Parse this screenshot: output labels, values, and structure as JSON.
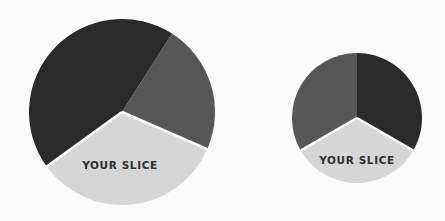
{
  "colors": {
    "background": "#fbfbfb",
    "dark": "#2a2a2a",
    "medium": "#575757",
    "light": "#d6d6d6",
    "separator": "#ffffff",
    "label": "#2f2f2f"
  },
  "chart_data": [
    {
      "type": "pie",
      "title": "",
      "center": [
        122,
        112
      ],
      "radius": 93,
      "start_angle_deg": 32.5,
      "direction": "clockwise-from-top",
      "slices": [
        {
          "name": "medium-slice",
          "label": "",
          "value": 22.5,
          "color": "#575757"
        },
        {
          "name": "your-slice",
          "label": "YOUR SLICE",
          "value": 33.5,
          "color": "#d6d6d6"
        },
        {
          "name": "dark-slice",
          "label": "",
          "value": 44.0,
          "color": "#2a2a2a"
        }
      ]
    },
    {
      "type": "pie",
      "title": "",
      "center": [
        357,
        118
      ],
      "radius": 65,
      "start_angle_deg": 0,
      "direction": "clockwise-from-top",
      "slices": [
        {
          "name": "dark-slice",
          "label": "",
          "value": 33.33,
          "color": "#2a2a2a"
        },
        {
          "name": "your-slice",
          "label": "YOUR SLICE",
          "value": 33.33,
          "color": "#d6d6d6"
        },
        {
          "name": "medium-slice",
          "label": "",
          "value": 33.34,
          "color": "#575757"
        }
      ]
    }
  ],
  "labels": {
    "big_pie_slice": "YOUR SLICE",
    "small_pie_slice": "YOUR SLICE"
  }
}
